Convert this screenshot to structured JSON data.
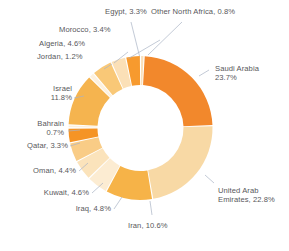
{
  "chart_data": {
    "type": "pie",
    "variant": "donut",
    "title": "",
    "subtitle": "",
    "xlabel": "",
    "ylabel": "",
    "legend": "none",
    "grid": false,
    "value_unit": "percent",
    "start_angle_deg": 0,
    "direction": "clockwise",
    "categories": [
      "Other North Africa",
      "Saudi Arabia",
      "United Arab Emirates",
      "Iran",
      "Iraq",
      "Kuwait",
      "Oman",
      "Qatar",
      "Bahrain",
      "Israel",
      "Jordan",
      "Algeria",
      "Morocco",
      "Egypt"
    ],
    "values": [
      0.8,
      23.7,
      22.8,
      10.6,
      4.8,
      4.6,
      4.4,
      3.3,
      0.7,
      11.8,
      1.2,
      4.6,
      3.4,
      3.3
    ],
    "colors": [
      "#fbe2bd",
      "#f4902c",
      "#f9d9a6",
      "#f7b košu"
    ],
    "slices": [
      {
        "name": "Other North Africa",
        "value": 0.8,
        "label": "Other North Africa, 0.8%",
        "color": "#fae0bb"
      },
      {
        "name": "Saudi Arabia",
        "value": 23.7,
        "label": "Saudi Arabia 23.7%",
        "color": "#f2882c"
      },
      {
        "name": "United Arab Emirates",
        "value": 22.8,
        "label": "United Arab Emirates, 22.8%",
        "color": "#f8d9a5"
      },
      {
        "name": "Iran",
        "value": 10.6,
        "label": "Iran, 10.6%",
        "color": "#f6b348"
      },
      {
        "name": "Iraq",
        "value": 4.8,
        "label": "Iraq, 4.8%",
        "color": "#fcecd2"
      },
      {
        "name": "Kuwait",
        "value": 4.6,
        "label": "Kuwait, 4.6%",
        "color": "#fbe3bb"
      },
      {
        "name": "Oman",
        "value": 4.4,
        "label": "Oman, 4.4%",
        "color": "#f9cc86"
      },
      {
        "name": "Qatar",
        "value": 3.3,
        "label": "Qatar, 3.3%",
        "color": "#f59425"
      },
      {
        "name": "Bahrain",
        "value": 0.7,
        "label": "Bahrain 0.7%",
        "color": "#fdf0dd"
      },
      {
        "name": "Israel",
        "value": 11.8,
        "label": "Israel 11.8%",
        "color": "#f5b44f"
      },
      {
        "name": "Jordan",
        "value": 1.2,
        "label": "Jordan, 1.2%",
        "color": "#fdf1de"
      },
      {
        "name": "Algeria",
        "value": 4.6,
        "label": "Algeria, 4.6%",
        "color": "#f9c877"
      },
      {
        "name": "Morocco",
        "value": 3.4,
        "label": "Morocco, 3.4%",
        "color": "#fbe0b7"
      },
      {
        "name": "Egypt",
        "value": 3.3,
        "label": "Egypt, 3.3%",
        "color": "#f79a2e"
      }
    ]
  },
  "labels": {
    "egypt": "Egypt, 3.3%",
    "other_north_africa": "Other North Africa, 0.8%",
    "morocco": "Morocco, 3.4%",
    "algeria": "Algeria, 4.6%",
    "jordan": "Jordan, 1.2%",
    "israel_l1": "Israel",
    "israel_l2": "11.8%",
    "bahrain_l1": "Bahrain",
    "bahrain_l2": "0.7%",
    "qatar": "Qatar, 3.3%",
    "oman": "Oman, 4.4%",
    "kuwait": "Kuwait, 4.6%",
    "iraq": "Iraq, 4.8%",
    "iran": "Iran, 10.6%",
    "saudi_l1": "Saudi Arabia",
    "saudi_l2": "23.7%",
    "uae_l1": "United Arab",
    "uae_l2": "Emirates, 22.8%"
  },
  "style": {
    "text_color": "#58585b",
    "leader_color": "#a9b3c4",
    "background": "#ffffff"
  }
}
